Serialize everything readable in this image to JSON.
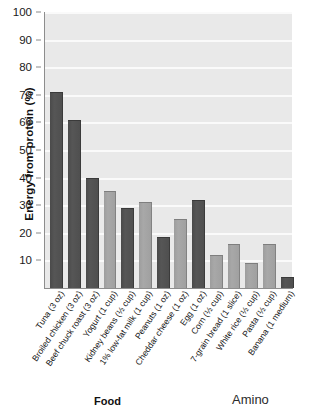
{
  "chart_data": {
    "type": "bar",
    "title": "",
    "xlabel": "Food",
    "ylabel": "Energy from protein (%)",
    "ylim": [
      0,
      100
    ],
    "yticks": [
      10,
      20,
      30,
      40,
      50,
      60,
      70,
      80,
      90,
      100
    ],
    "grid": true,
    "legend": "none",
    "categories": [
      "Tuna (3 oz)",
      "Broiled chicken (3 oz)",
      "Beef chuck roast (3 oz)",
      "Yogurt (1 cup)",
      "Kidney beans (1/2 cup)",
      "1% low-fat milk (1 cup)",
      "Peanuts (1 oz)",
      "Cheddar cheese (1 oz)",
      "Egg (1 oz)",
      "Corn (1/2 cup)",
      "7-grain bread (1 slice)",
      "White rice (1/2 cup)",
      "Pasta (1/2 cup)",
      "Banana (1 medium)"
    ],
    "values": [
      71,
      61,
      40,
      35,
      29,
      31,
      18.5,
      25,
      32,
      12,
      16,
      9,
      16,
      4
    ],
    "bar_shades": [
      "dark",
      "dark",
      "dark",
      "light",
      "dark",
      "light",
      "dark",
      "light",
      "dark",
      "light",
      "light",
      "light",
      "light",
      "dark"
    ]
  },
  "axes": {
    "y_title": "Energy from protein (%)",
    "x_title": "Food"
  },
  "side_caption": "Amino",
  "colors": {
    "plot_background": "#e9e9e9",
    "gridline": "#fafafa",
    "bar_dark": "#4f4f4f",
    "bar_light": "#a0a0a0",
    "axis": "#8d8d8d",
    "text": "#151515"
  }
}
